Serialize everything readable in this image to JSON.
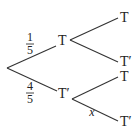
{
  "tree": {
    "root": {
      "x": 7,
      "y": 68
    },
    "level1": [
      {
        "id": "upper",
        "label": "T",
        "prob_num": "1",
        "prob_den": "5",
        "children": [
          {
            "label": "T",
            "prob": ""
          },
          {
            "label": "T′",
            "prob": ""
          }
        ]
      },
      {
        "id": "lower",
        "label": "T′",
        "prob_num": "4",
        "prob_den": "5",
        "children": [
          {
            "label": "T",
            "prob": ""
          },
          {
            "label": "T′",
            "prob": "x"
          }
        ]
      }
    ]
  },
  "colors": {
    "line": "#333333",
    "text": "#222222",
    "background": "#ffffff"
  }
}
